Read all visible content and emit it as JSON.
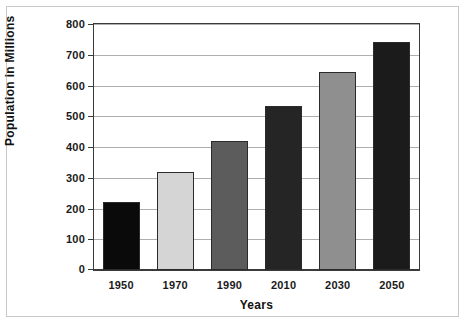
{
  "chart_data": {
    "type": "bar",
    "title": "",
    "xlabel": "Years",
    "ylabel": "Population in Millions",
    "categories": [
      "1950",
      "1970",
      "1990",
      "2010",
      "2030",
      "2050"
    ],
    "values": [
      220,
      320,
      420,
      535,
      645,
      740
    ],
    "ylim": [
      0,
      800
    ],
    "ytick_step": 100,
    "yticks": [
      "0",
      "100",
      "200",
      "300",
      "400",
      "500",
      "600",
      "700",
      "800"
    ],
    "grid": true,
    "legend": "none",
    "bar_colors": [
      "#0a0a0a",
      "#d5d5d5",
      "#5c5c5c",
      "#252525",
      "#8f8f8f",
      "#1b1b1b"
    ],
    "bar_edge_color": "#2b2b2b",
    "gridline_color": "#aeaeae",
    "axis_color": "#3a3a3a",
    "frame_color": "#c8c8c8",
    "background": "#ffffff"
  }
}
